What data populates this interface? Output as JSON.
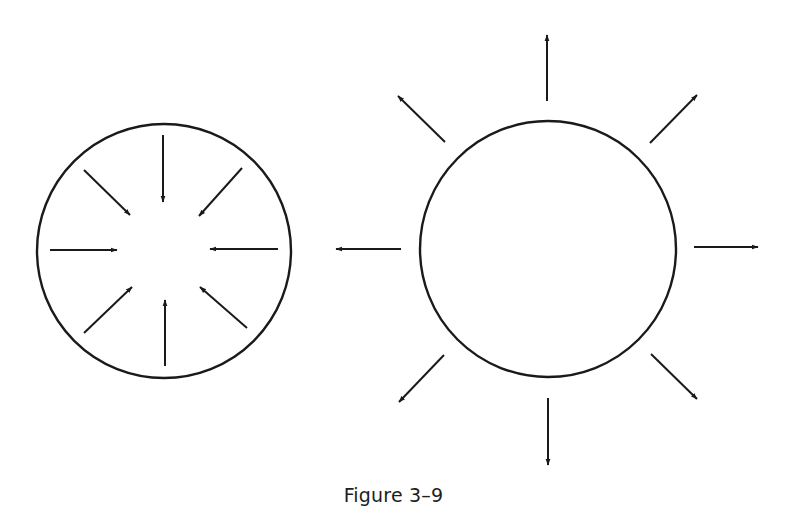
{
  "figure": {
    "caption": "Figure 3–9",
    "stroke_color": "#1a1a1a",
    "background": "#ffffff"
  },
  "diagram": {
    "panels": [
      {
        "id": "converging",
        "description": "Circle with eight arrows pointing inward toward center",
        "circle": {
          "cx": 164,
          "cy": 251,
          "r": 127
        },
        "arrow_direction": "inward",
        "arrows": [
          {
            "from": [
              163,
              135
            ],
            "to": [
              163,
              202
            ]
          },
          {
            "from": [
              242,
              168
            ],
            "to": [
              199,
              216
            ]
          },
          {
            "from": [
              278,
              249
            ],
            "to": [
              210,
              249
            ]
          },
          {
            "from": [
              247,
              328
            ],
            "to": [
              200,
              287
            ]
          },
          {
            "from": [
              165,
              366
            ],
            "to": [
              165,
              300
            ]
          },
          {
            "from": [
              84,
              333
            ],
            "to": [
              132,
              287
            ]
          },
          {
            "from": [
              50,
              250
            ],
            "to": [
              117,
              250
            ]
          },
          {
            "from": [
              84,
              170
            ],
            "to": [
              130,
              215
            ]
          }
        ]
      },
      {
        "id": "diverging",
        "description": "Circle with eight arrows outside pointing outward",
        "circle": {
          "cx": 548,
          "cy": 249,
          "r": 128
        },
        "arrow_direction": "outward",
        "arrows": [
          {
            "from": [
              547,
              101
            ],
            "to": [
              547,
              35
            ]
          },
          {
            "from": [
              650,
              143
            ],
            "to": [
              697,
              95
            ]
          },
          {
            "from": [
              694,
              247
            ],
            "to": [
              758,
              247
            ]
          },
          {
            "from": [
              651,
              354
            ],
            "to": [
              697,
              399
            ]
          },
          {
            "from": [
              548,
              398
            ],
            "to": [
              548,
              465
            ]
          },
          {
            "from": [
              444,
              355
            ],
            "to": [
              399,
              402
            ]
          },
          {
            "from": [
              401,
              249
            ],
            "to": [
              336,
              249
            ]
          },
          {
            "from": [
              445,
              142
            ],
            "to": [
              398,
              96
            ]
          }
        ]
      }
    ]
  }
}
